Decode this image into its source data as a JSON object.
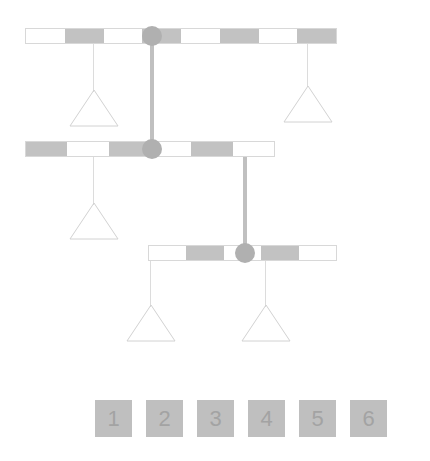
{
  "puzzle": {
    "title": "Balance mobile puzzle",
    "colors": {
      "beam_fill_dark": "#c2c2c2",
      "beam_fill_light": "#ffffff",
      "beam_border": "#d8d8d8",
      "pivot": "#b0b0b0",
      "rod": "#c0c0c0",
      "string": "#dcdcdc",
      "triangle_stroke": "#d2d2d2",
      "tile_fill": "#bfbfbf",
      "tile_text": "#a3a3a3",
      "background": "#ffffff"
    },
    "beams": [
      {
        "id": "top-beam",
        "segments": [
          "off",
          "on",
          "off",
          "on",
          "off",
          "on",
          "off",
          "on"
        ],
        "pivot_position_index": 2,
        "hanger_count": 2
      },
      {
        "id": "middle-beam",
        "segments": [
          "on",
          "off",
          "on",
          "off",
          "on",
          "off"
        ],
        "pivot_position_index": 3,
        "hanger_count": 1
      },
      {
        "id": "bottom-beam",
        "segments": [
          "off",
          "on",
          "off",
          "on",
          "off"
        ],
        "pivot_position_index": 3,
        "hanger_count": 2
      }
    ],
    "weights": [
      {
        "id": "weight-top-left",
        "label": ""
      },
      {
        "id": "weight-top-right",
        "label": ""
      },
      {
        "id": "weight-middle-left",
        "label": ""
      },
      {
        "id": "weight-bottom-left",
        "label": ""
      },
      {
        "id": "weight-bottom-right",
        "label": ""
      }
    ]
  },
  "tiles": [
    {
      "label": "1"
    },
    {
      "label": "2"
    },
    {
      "label": "3"
    },
    {
      "label": "4"
    },
    {
      "label": "5"
    },
    {
      "label": "6"
    }
  ]
}
